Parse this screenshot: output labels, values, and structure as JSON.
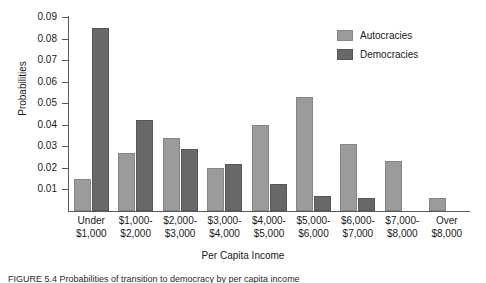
{
  "chart_data": {
    "type": "bar",
    "title": "",
    "xlabel": "Per Capita Income",
    "ylabel": "Probabilities",
    "ylim": [
      0,
      0.09
    ],
    "yticks": [
      "0.01",
      "0.02",
      "0.03",
      "0.04",
      "0.05",
      "0.06",
      "0.07",
      "0.08",
      "0.09"
    ],
    "ytick_values": [
      0.01,
      0.02,
      0.03,
      0.04,
      0.05,
      0.06,
      0.07,
      0.08,
      0.09
    ],
    "grid": false,
    "legend_position": "top-right",
    "categories": [
      "Under $1,000",
      "$1,000-$2,000",
      "$2,000-$3,000",
      "$3,000-$4,000",
      "$4,000-$5,000",
      "$5,000-$6,000",
      "$6,000-$7,000",
      "$7,000-$8,000",
      "Over $8,000"
    ],
    "category_lines": [
      [
        "Under",
        "$1,000"
      ],
      [
        "$1,000-",
        "$2,000"
      ],
      [
        "$2,000-",
        "$3,000"
      ],
      [
        "$3,000-",
        "$4,000"
      ],
      [
        "$4,000-",
        "$5,000"
      ],
      [
        "$5,000-",
        "$6,000"
      ],
      [
        "$6,000-",
        "$7,000"
      ],
      [
        "$7,000-",
        "$8,000"
      ],
      [
        "Over",
        "$8,000"
      ]
    ],
    "series": [
      {
        "name": "Autocracies",
        "color": "#9b9b9b",
        "values": [
          0.015,
          0.027,
          0.034,
          0.02,
          0.04,
          0.053,
          0.031,
          0.023,
          0.006
        ]
      },
      {
        "name": "Democracies",
        "color": "#686868",
        "values": [
          0.085,
          0.042,
          0.029,
          0.022,
          0.0125,
          0.007,
          0.006,
          0.0,
          0.0
        ]
      }
    ]
  },
  "legend": {
    "items": [
      {
        "label": "Autocracies",
        "color": "#9b9b9b"
      },
      {
        "label": "Democracies",
        "color": "#686868"
      }
    ]
  },
  "caption": {
    "text": "FIGURE 5.4   Probabilities of transition to democracy by per capita income"
  }
}
